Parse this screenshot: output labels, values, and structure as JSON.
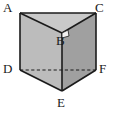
{
  "figure": {
    "name": "triangular-prism-diagram",
    "shape": "triangular prism",
    "background_color": "#ffffff",
    "stroke_color": "#1b1b1b",
    "faces": {
      "top_triangle_color": "#c9c9c9",
      "left_face_color": "#bcbcbc",
      "right_face_color": "#a0a0a0"
    },
    "labels": {
      "a": "A",
      "b": "B",
      "c": "C",
      "d": "D",
      "e": "E",
      "f": "F"
    },
    "vertices": {
      "A": {
        "x": 20,
        "y": 13
      },
      "B": {
        "x": 62,
        "y": 33
      },
      "C": {
        "x": 96,
        "y": 13
      },
      "D": {
        "x": 20,
        "y": 70
      },
      "E": {
        "x": 62,
        "y": 91
      },
      "F": {
        "x": 96,
        "y": 70
      }
    },
    "label_positions": {
      "A": {
        "x": 3,
        "y": 1
      },
      "B": {
        "x": 56,
        "y": 34
      },
      "C": {
        "x": 95,
        "y": 1
      },
      "D": {
        "x": 3,
        "y": 62
      },
      "E": {
        "x": 57,
        "y": 96
      },
      "F": {
        "x": 99,
        "y": 62
      }
    },
    "hidden_edges": [
      "D-F"
    ],
    "right_angle_marker_at": "B"
  }
}
